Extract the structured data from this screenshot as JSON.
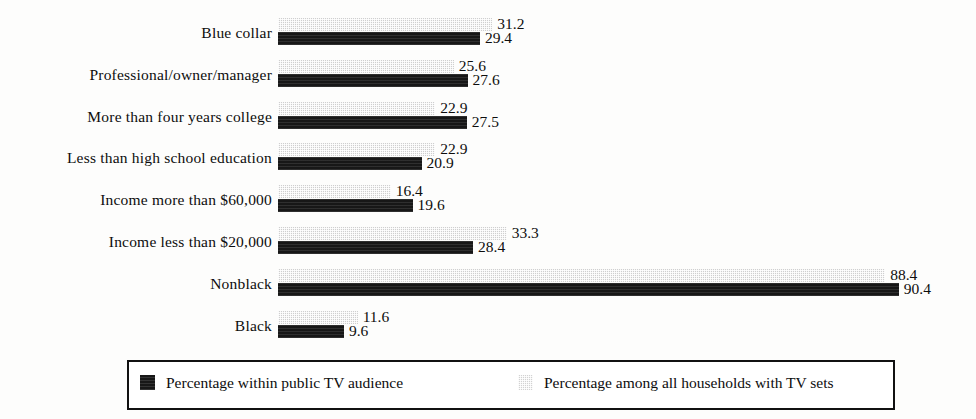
{
  "chart_data": {
    "type": "bar",
    "orientation": "horizontal",
    "title": "",
    "subtitle": "",
    "xlabel": "",
    "ylabel": "",
    "grid": false,
    "legend_position": "bottom",
    "xlim": [
      0,
      100
    ],
    "categories": [
      "Blue collar",
      "Professional/owner/manager",
      "More than four years college",
      "Less than high school education",
      "Income more than $60,000",
      "Income less than $20,000",
      "Nonblack",
      "Black"
    ],
    "series": [
      {
        "name": "Percentage among all households with TV sets",
        "key": "light",
        "values": [
          31.2,
          25.6,
          22.9,
          22.9,
          16.4,
          33.3,
          88.4,
          11.6
        ],
        "labels": [
          "31.2",
          "25.6",
          "22.9",
          "22.9",
          "16.4",
          "33.3",
          "88.4",
          "11.6"
        ]
      },
      {
        "name": "Percentage within public TV audience",
        "key": "dark",
        "values": [
          29.4,
          27.6,
          27.5,
          20.9,
          19.6,
          28.4,
          90.4,
          9.6
        ],
        "labels": [
          "29.4",
          "27.6",
          "27.5",
          "20.9",
          "19.6",
          "28.4",
          "90.4",
          "9.6"
        ]
      }
    ]
  },
  "legend": {
    "entries": [
      {
        "label": "Percentage within public TV audience",
        "swatch": "dark"
      },
      {
        "label": "Percentage among all households with TV sets",
        "swatch": "light"
      }
    ]
  },
  "colors": {
    "dark_series": "#171717",
    "light_series": "#cfcfcf",
    "text": "#0d0d0d",
    "background": "#fdfdfc",
    "legend_border": "#111111"
  }
}
